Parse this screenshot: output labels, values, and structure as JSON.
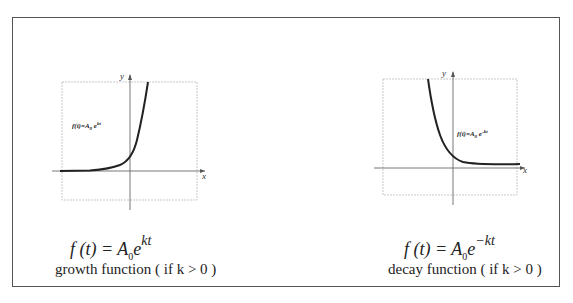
{
  "figure": {
    "panels": [
      {
        "name": "growth",
        "graph_label": "f(t)=A0 e^kt",
        "axis_x": "x",
        "axis_y": "y",
        "equation": {
          "lhs": "f (t) = ",
          "A": "A",
          "sub": "0",
          "e": "e",
          "exp": "kt"
        },
        "caption": "growth function ( if k > 0 )"
      },
      {
        "name": "decay",
        "graph_label": "f(t)=A0 e^-kt",
        "axis_x": "x",
        "axis_y": "y",
        "equation": {
          "lhs": "f (t) = ",
          "A": "A",
          "sub": "0",
          "e": "e",
          "exp": "−kt"
        },
        "caption": "decay function ( if k > 0 )"
      }
    ]
  }
}
